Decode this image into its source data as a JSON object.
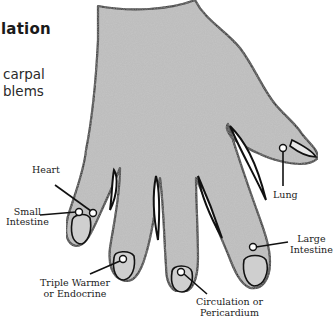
{
  "page": {
    "heading_fragment": "lation",
    "body_lines": [
      "carpal",
      "blems"
    ]
  },
  "diagram": {
    "fill_color": "#bdbdbd",
    "outline_color": "#111111",
    "labels": {
      "heart": "Heart",
      "small_intestine_1": "Small",
      "small_intestine_2": "Intestine",
      "triple_warmer_1": "Triple Warmer",
      "triple_warmer_2": "or Endocrine",
      "circulation_1": "Circulation or",
      "circulation_2": "Pericardium",
      "large_intestine_1": "Large",
      "large_intestine_2": "Intestine",
      "lung": "Lung"
    }
  }
}
